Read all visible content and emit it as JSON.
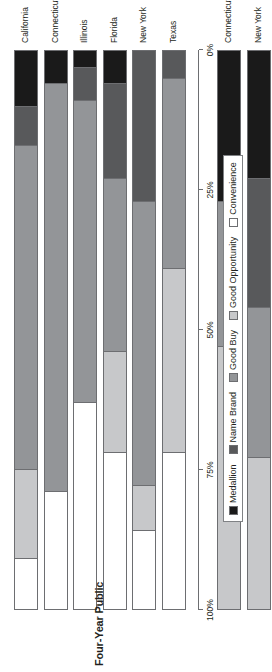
{
  "chart_data": {
    "type": "bar",
    "orientation": "horizontal-stacked",
    "title": "",
    "xlabel": "",
    "ylabel": "",
    "xlim": [
      0,
      100
    ],
    "grid": false,
    "legend_position": "bottom",
    "tick_labels": [
      "0%",
      "25%",
      "50%",
      "75%",
      "100%"
    ],
    "tick_values": [
      0,
      25,
      50,
      75,
      100
    ],
    "series": [
      {
        "name": "Medallion",
        "color": "#1a1a1a"
      },
      {
        "name": "Name Brand",
        "color": "#58595b"
      },
      {
        "name": "Good Buy",
        "color": "#939598"
      },
      {
        "name": "Good Opportunity",
        "color": "#c7c8ca"
      },
      {
        "name": "Convenience",
        "color": "#ffffff"
      }
    ],
    "groups": [
      {
        "label": "Four-Year Public",
        "categories": [
          "California",
          "Connecticut",
          "Illinois",
          "Florida",
          "New York",
          "Texas"
        ],
        "values": [
          {
            "category": "California",
            "Medallion": 10,
            "Name Brand": 7,
            "Good Buy": 58,
            "Good Opportunity": 16,
            "Convenience": 9
          },
          {
            "category": "Connecticut",
            "Medallion": 6,
            "Name Brand": 0,
            "Good Buy": 73,
            "Good Opportunity": 0,
            "Convenience": 21
          },
          {
            "category": "Illinois",
            "Medallion": 3,
            "Name Brand": 6,
            "Good Buy": 54,
            "Good Opportunity": 0,
            "Convenience": 37
          },
          {
            "category": "Florida",
            "Medallion": 6,
            "Name Brand": 17,
            "Good Buy": 31,
            "Good Opportunity": 18,
            "Convenience": 28
          },
          {
            "category": "New York",
            "Medallion": 0,
            "Name Brand": 27,
            "Good Buy": 51,
            "Good Opportunity": 8,
            "Convenience": 14
          },
          {
            "category": "Texas",
            "Medallion": 0,
            "Name Brand": 5,
            "Good Buy": 34,
            "Good Opportunity": 33,
            "Convenience": 28
          }
        ]
      },
      {
        "label": "Four-Year Private Not-for-Profit",
        "categories": [
          "Connecticut",
          "New York",
          "California",
          "Illinois",
          "Florida",
          "Texas"
        ],
        "values": [
          {
            "category": "Connecticut",
            "Medallion": 27,
            "Name Brand": 0,
            "Good Buy": 26,
            "Good Opportunity": 47,
            "Convenience": 0
          },
          {
            "category": "New York",
            "Medallion": 23,
            "Name Brand": 23,
            "Good Buy": 27,
            "Good Opportunity": 27,
            "Convenience": 0
          },
          {
            "category": "California",
            "Medallion": 20,
            "Name Brand": 18,
            "Good Buy": 30,
            "Good Opportunity": 18,
            "Convenience": 14
          },
          {
            "category": "Illinois",
            "Medallion": 12,
            "Name Brand": 14,
            "Good Buy": 50,
            "Good Opportunity": 23,
            "Convenience": 1
          },
          {
            "category": "Florida",
            "Medallion": 1,
            "Name Brand": 3,
            "Good Buy": 36,
            "Good Opportunity": 40,
            "Convenience": 20
          },
          {
            "category": "Texas",
            "Medallion": 2,
            "Name Brand": 18,
            "Good Buy": 6,
            "Good Opportunity": 67,
            "Convenience": 7
          }
        ]
      }
    ]
  },
  "legend": {
    "items": [
      {
        "label": "Medallion",
        "color": "#1a1a1a"
      },
      {
        "label": "Name Brand",
        "color": "#58595b"
      },
      {
        "label": "Good Buy",
        "color": "#939598"
      },
      {
        "label": "Good Opportunity",
        "color": "#c7c8ca"
      },
      {
        "label": "Convenience",
        "color": "#ffffff"
      }
    ]
  }
}
